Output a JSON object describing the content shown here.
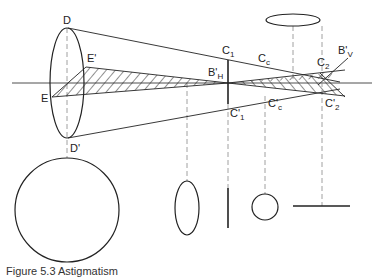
{
  "diagram": {
    "type": "optics-astigmatism",
    "colors": {
      "stroke": "#222222",
      "dashed": "#888888",
      "background": "#ffffff"
    },
    "labels": {
      "D": "D",
      "D_prime": "D'",
      "E": "E",
      "E_prime": "E'",
      "C1": "C",
      "C1_sub": "1",
      "C1_prime": "C'",
      "C1_prime_sub": "1",
      "Cc": "C",
      "Cc_sub": "c",
      "Cc_prime": "C'",
      "Cc_prime_sub": "c",
      "C2": "C",
      "C2_sub": "2",
      "C2_prime": "C'",
      "C2_prime_sub": "2",
      "BH": "B'",
      "BH_sub": "H",
      "BV": "B'",
      "BV_sub": "V"
    },
    "cross_sections": [
      "horizontal-ellipse",
      "circle-large",
      "vertical-ellipse",
      "vertical-line",
      "circle-small",
      "horizontal-line"
    ]
  },
  "caption": "Figure 5.3 Astigmatism"
}
